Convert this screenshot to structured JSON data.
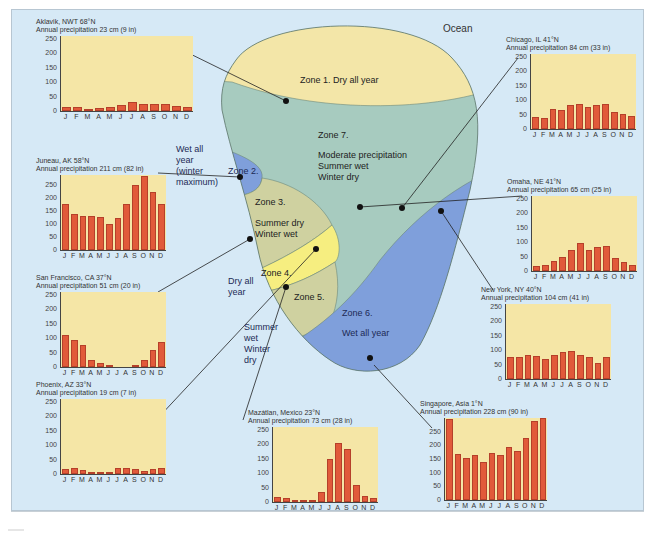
{
  "diagram": {
    "ocean_label": "Ocean",
    "zones": [
      {
        "id": 1,
        "label": "Zone 1.  Dry all year",
        "color": "#f3e6a8"
      },
      {
        "id": 2,
        "label": "Zone 2.",
        "side_label": [
          "Wet all",
          "year",
          "(winter",
          "maximum)"
        ],
        "color": "#7f9fdb"
      },
      {
        "id": 3,
        "label": "Zone 3.",
        "desc": [
          "Summer dry",
          "Winter wet"
        ],
        "color": "#cfd1a0"
      },
      {
        "id": 4,
        "label": "Zone 4.",
        "side_label": [
          "Dry all",
          "year"
        ],
        "color": "#f6ee80"
      },
      {
        "id": 5,
        "label": "Zone 5.",
        "side_label": [
          "Summer",
          "wet",
          "Winter",
          "dry"
        ],
        "color": "#cfd1a0"
      },
      {
        "id": 6,
        "label": "Zone 6.",
        "desc": [
          "Wet all year"
        ],
        "color": "#7f9fdb"
      },
      {
        "id": 7,
        "label": "Zone 7.",
        "desc": [
          "Moderate precipitation",
          "Summer wet",
          "Winter dry"
        ],
        "color": "#a7cbbf"
      }
    ],
    "colors": {
      "background": "#d6e9f6",
      "plot_fill": "#f5e6a6",
      "bar_fill": "#e15a3a",
      "bar_edge": "#b5402a"
    }
  },
  "months": [
    "J",
    "F",
    "M",
    "A",
    "M",
    "J",
    "J",
    "A",
    "S",
    "O",
    "N",
    "D"
  ],
  "yticks": [
    "250",
    "200",
    "150",
    "100",
    "50",
    "0"
  ],
  "chart_data": [
    {
      "type": "bar",
      "title": "Aklavik, NWT 68°N",
      "subtitle": "Annual precipitation 23 cm (9 in)",
      "categories": [
        "J",
        "F",
        "M",
        "A",
        "M",
        "J",
        "J",
        "A",
        "S",
        "O",
        "N",
        "D"
      ],
      "values": [
        15,
        15,
        8,
        10,
        15,
        20,
        30,
        23,
        25,
        25,
        18,
        13
      ],
      "ylim": [
        0,
        260
      ],
      "ylabel": "mm"
    },
    {
      "type": "bar",
      "title": "Juneau, AK 58°N",
      "subtitle": "Annual precipitation 211 cm (82 in)",
      "categories": [
        "J",
        "F",
        "M",
        "A",
        "M",
        "J",
        "J",
        "A",
        "S",
        "O",
        "N",
        "D"
      ],
      "values": [
        178,
        138,
        132,
        133,
        127,
        100,
        122,
        178,
        250,
        285,
        223,
        178
      ],
      "ylim": [
        0,
        290
      ],
      "ylabel": "mm"
    },
    {
      "type": "bar",
      "title": "San Francisco, CA 37°N",
      "subtitle": "Annual precipitation 51 cm (20 in)",
      "categories": [
        "J",
        "F",
        "M",
        "A",
        "M",
        "J",
        "J",
        "A",
        "S",
        "O",
        "N",
        "D"
      ],
      "values": [
        110,
        95,
        75,
        25,
        13,
        5,
        0,
        0,
        8,
        25,
        58,
        85
      ],
      "ylim": [
        0,
        260
      ],
      "ylabel": "mm"
    },
    {
      "type": "bar",
      "title": "Phoenix, AZ 33°N",
      "subtitle": "Annual precipitation 19 cm (7 in)",
      "categories": [
        "J",
        "F",
        "M",
        "A",
        "M",
        "J",
        "J",
        "A",
        "S",
        "O",
        "N",
        "D"
      ],
      "values": [
        18,
        20,
        15,
        8,
        3,
        2,
        20,
        20,
        18,
        10,
        18,
        20
      ],
      "ylim": [
        0,
        260
      ],
      "ylabel": "mm"
    },
    {
      "type": "bar",
      "title": "Mazátlan, Mexico 23°N",
      "subtitle": "Annual precipitation 73 cm (28 in)",
      "categories": [
        "J",
        "F",
        "M",
        "A",
        "M",
        "J",
        "J",
        "A",
        "S",
        "O",
        "N",
        "D"
      ],
      "values": [
        18,
        15,
        8,
        8,
        8,
        35,
        150,
        205,
        185,
        58,
        20,
        15
      ],
      "ylim": [
        0,
        260
      ],
      "ylabel": "mm"
    },
    {
      "type": "bar",
      "title": "Singapore, Asia 1°N",
      "subtitle": "Annual precipitation 228 cm (90 in)",
      "categories": [
        "J",
        "F",
        "M",
        "A",
        "M",
        "J",
        "J",
        "A",
        "S",
        "O",
        "N",
        "D"
      ],
      "values": [
        295,
        170,
        152,
        163,
        140,
        173,
        163,
        193,
        178,
        228,
        290,
        300
      ],
      "ylim": [
        0,
        300
      ],
      "ylabel": "mm"
    },
    {
      "type": "bar",
      "title": "New York, NY 40°N",
      "subtitle": "Annual precipitation 104 cm (41 in)",
      "categories": [
        "J",
        "F",
        "M",
        "A",
        "M",
        "J",
        "J",
        "A",
        "S",
        "O",
        "N",
        "D"
      ],
      "values": [
        75,
        78,
        83,
        80,
        68,
        83,
        93,
        96,
        83,
        75,
        55,
        75
      ],
      "ylim": [
        0,
        260
      ],
      "ylabel": "mm"
    },
    {
      "type": "bar",
      "title": "Omaha, NE 41°N",
      "subtitle": "Annual precipitation 65 cm (25 in)",
      "categories": [
        "J",
        "F",
        "M",
        "A",
        "M",
        "J",
        "J",
        "A",
        "S",
        "O",
        "N",
        "D"
      ],
      "values": [
        18,
        20,
        33,
        48,
        73,
        98,
        73,
        83,
        85,
        45,
        30,
        20
      ],
      "ylim": [
        0,
        260
      ],
      "ylabel": "mm"
    },
    {
      "type": "bar",
      "title": "Chicago, IL 41°N",
      "subtitle": "Annual precipitation 84 cm (33 in)",
      "categories": [
        "J",
        "F",
        "M",
        "A",
        "M",
        "J",
        "J",
        "A",
        "S",
        "O",
        "N",
        "D"
      ],
      "values": [
        43,
        38,
        68,
        65,
        83,
        88,
        78,
        83,
        88,
        60,
        53,
        45
      ],
      "ylim": [
        0,
        260
      ],
      "ylabel": "mm"
    }
  ]
}
